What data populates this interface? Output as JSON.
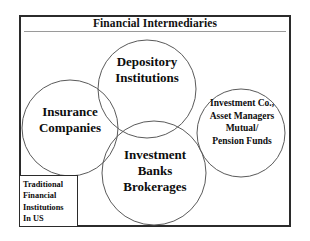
{
  "diagram": {
    "title": "Financial Intermediaries",
    "type": "venn-diagram",
    "frame_color": "#2b2b2b",
    "circle_stroke_color": "#5a5a5a",
    "background_color": "#ffffff",
    "circles": [
      {
        "id": "depository",
        "label_lines": [
          "Depository",
          "Institutions"
        ],
        "cx": 147,
        "cy": 89,
        "r": 49
      },
      {
        "id": "insurance",
        "label_lines": [
          "Insurance",
          "Companies"
        ],
        "cx": 70,
        "cy": 128,
        "r": 48
      },
      {
        "id": "investment-banks",
        "label_lines": [
          "Investment",
          "Banks",
          "Brokerages"
        ],
        "cx": 154,
        "cy": 173,
        "r": 52
      },
      {
        "id": "asset-managers",
        "label_lines": [
          "Investment Co.,",
          "Asset Managers",
          "Mutual/",
          "Pension Funds"
        ],
        "cx": 241,
        "cy": 133,
        "r": 44
      }
    ],
    "callout": {
      "id": "traditional-institutions",
      "lines": [
        "Traditional",
        "Financial",
        "Institutions",
        "In US"
      ]
    }
  }
}
